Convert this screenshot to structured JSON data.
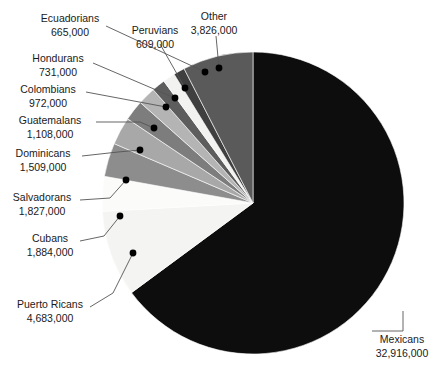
{
  "chart_data": {
    "type": "pie",
    "title": "",
    "xlabel": "",
    "ylabel": "",
    "legend_position": "none",
    "grid": false,
    "units": "people",
    "label_format": "name + population with thousands separators",
    "start_angle_deg": 0,
    "direction": "clockwise",
    "total": 51730000,
    "categories": [
      "Mexicans",
      "Puerto Ricans",
      "Cubans",
      "Salvadorans",
      "Dominicans",
      "Guatemalans",
      "Colombians",
      "Hondurans",
      "Ecuadorians",
      "Peruvians",
      "Other"
    ],
    "values": [
      32916000,
      4683000,
      1884000,
      1827000,
      1509000,
      1108000,
      972000,
      731000,
      665000,
      609000,
      3826000
    ],
    "slices": [
      {
        "name": "Mexicans",
        "value": 32916000,
        "value_label": "32,916,000",
        "color": "#0d0d0d"
      },
      {
        "name": "Puerto Ricans",
        "value": 4683000,
        "value_label": "4,683,000",
        "color": "#f4f4f2"
      },
      {
        "name": "Cubans",
        "value": 1884000,
        "value_label": "1,884,000",
        "color": "#fbfbfa"
      },
      {
        "name": "Salvadorans",
        "value": 1827000,
        "value_label": "1,827,000",
        "color": "#8d8d8d"
      },
      {
        "name": "Dominicans",
        "value": 1509000,
        "value_label": "1,509,000",
        "color": "#a8a8a8"
      },
      {
        "name": "Guatemalans",
        "value": 1108000,
        "value_label": "1,108,000",
        "color": "#7d7d7d"
      },
      {
        "name": "Colombians",
        "value": 972000,
        "value_label": "972,000",
        "color": "#b4b4b4"
      },
      {
        "name": "Hondurans",
        "value": 731000,
        "value_label": "731,000",
        "color": "#5d5d5d"
      },
      {
        "name": "Ecuadorians",
        "value": 665000,
        "value_label": "665,000",
        "color": "#f2f2f0"
      },
      {
        "name": "Peruvians",
        "value": 609000,
        "value_label": "609,000",
        "color": "#3f3f3f"
      },
      {
        "name": "Other",
        "value": 3826000,
        "value_label": "3,826,000",
        "color": "#5a5a5a"
      }
    ]
  },
  "labels": {
    "ecuadorians": {
      "name": "Ecuadorians",
      "value": "665,000"
    },
    "peruvians": {
      "name": "Peruvians",
      "value": "609,000"
    },
    "other": {
      "name": "Other",
      "value": "3,826,000"
    },
    "hondurans": {
      "name": "Hondurans",
      "value": "731,000"
    },
    "colombians": {
      "name": "Colombians",
      "value": "972,000"
    },
    "guatemalans": {
      "name": "Guatemalans",
      "value": "1,108,000"
    },
    "dominicans": {
      "name": "Dominicans",
      "value": "1,509,000"
    },
    "salvadorans": {
      "name": "Salvadorans",
      "value": "1,827,000"
    },
    "cubans": {
      "name": "Cubans",
      "value": "1,884,000"
    },
    "puerto_ricans": {
      "name": "Puerto Ricans",
      "value": "4,683,000"
    },
    "mexicans": {
      "name": "Mexicans",
      "value": "32,916,000"
    }
  }
}
